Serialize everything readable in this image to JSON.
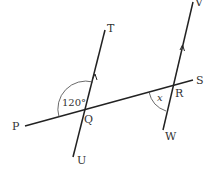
{
  "diagram": {
    "type": "parallel-lines-transversal",
    "points": {
      "P": "P",
      "Q": "Q",
      "R": "R",
      "S": "S",
      "T": "T",
      "U": "U",
      "V": "V",
      "W": "W"
    },
    "lines": [
      {
        "name": "PS",
        "from": "P",
        "to": "S"
      },
      {
        "name": "TU",
        "from": "T",
        "to": "U",
        "parallel_arrow": true
      },
      {
        "name": "VW",
        "from": "V",
        "to": "W",
        "parallel_arrow": true
      }
    ],
    "angles": {
      "TQP": "120°",
      "QRW": "x"
    },
    "colors": {
      "stroke": "#222222",
      "text": "#333333"
    }
  }
}
